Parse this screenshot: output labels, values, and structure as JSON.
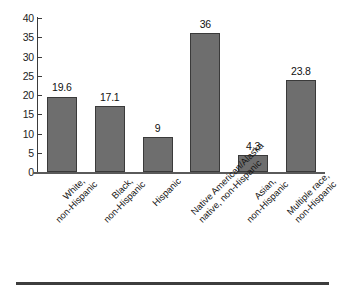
{
  "chart_data": {
    "type": "bar",
    "title": "",
    "subtitle": "",
    "xlabel": "",
    "ylabel": "",
    "ylim": [
      0,
      40
    ],
    "yticks": [
      0,
      5,
      10,
      15,
      20,
      25,
      30,
      35,
      40
    ],
    "ytick_labels": [
      "0",
      "5",
      "10",
      "15",
      "20",
      "25",
      "30",
      "35",
      "40"
    ],
    "grid": false,
    "legend": false,
    "legend_position": "none",
    "categories": [
      "White, non-Hispanic",
      "Black, non-Hispanic",
      "Hispanic",
      "Native American/Alaska native, non-Hispanic",
      "Asian, non-Hispanic",
      "Multiple race, non-Hispanic"
    ],
    "category_lines": [
      [
        "White,",
        "non-Hispanic"
      ],
      [
        "Black,",
        "non-Hispanic"
      ],
      [
        "Hispanic"
      ],
      [
        "Native American/Alaska",
        "native, non-Hispanic"
      ],
      [
        "Asian,",
        "non-Hispanic"
      ],
      [
        "Multiple race,",
        "non-Hispanic"
      ]
    ],
    "values": [
      19.6,
      17.1,
      9,
      36,
      4.3,
      23.8
    ],
    "value_labels": [
      "19.6",
      "17.1",
      "9",
      "36",
      "4.3",
      "23.8"
    ],
    "colors": {
      "bar_fill": "#6e6e6e",
      "bar_stroke": "#3a3a3a",
      "axis": "#3b3b3b",
      "text": "#161616",
      "background": "#ffffff",
      "rule": "#3d3d3d"
    }
  }
}
